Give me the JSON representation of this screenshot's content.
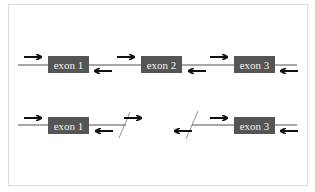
{
  "colors": {
    "exon_fill": "#555555",
    "exon_text": "#f2f2f2",
    "intron_line": "#8a8a8a",
    "arrow": "#111111",
    "frame_border": "#d6dde3",
    "break_line": "#777777"
  },
  "rows": [
    {
      "name": "full-gene",
      "exons": [
        {
          "label": "exon 1"
        },
        {
          "label": "exon 2"
        },
        {
          "label": "exon 3"
        }
      ],
      "primers": [
        {
          "direction": "forward",
          "position": "before exon 1"
        },
        {
          "direction": "reverse",
          "position": "after exon 1"
        },
        {
          "direction": "forward",
          "position": "before exon 2"
        },
        {
          "direction": "reverse",
          "position": "after exon 2"
        },
        {
          "direction": "forward",
          "position": "before exon 3"
        },
        {
          "direction": "reverse",
          "position": "after exon 3"
        }
      ]
    },
    {
      "name": "deleted-gene",
      "exons": [
        {
          "label": "exon 1"
        },
        {
          "label": "exon 3"
        }
      ],
      "primers": [
        {
          "direction": "forward",
          "position": "before exon 1"
        },
        {
          "direction": "reverse",
          "position": "after exon 1"
        },
        {
          "direction": "forward",
          "position": "at break, right"
        },
        {
          "direction": "reverse",
          "position": "at break, left"
        },
        {
          "direction": "forward",
          "position": "before exon 3"
        },
        {
          "direction": "reverse",
          "position": "after exon 3"
        }
      ],
      "breaks": 2
    }
  ]
}
